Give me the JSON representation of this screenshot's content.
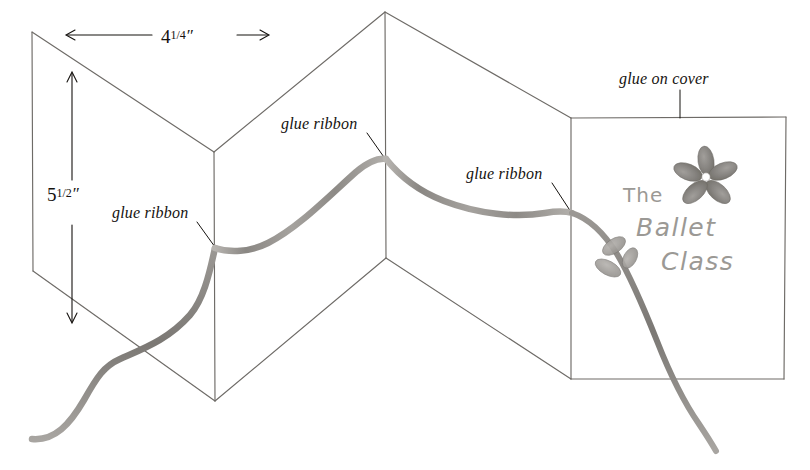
{
  "drawing": {
    "title": "Accordion-fold greeting card assembly diagram",
    "medium": "pencil sketch on white paper",
    "background_color": "#ffffff",
    "line_color": "#6e6b67",
    "ink_color": "#15120f",
    "ribbon_color": "#8d8a86",
    "cover_pencil_color": "#9b9995"
  },
  "dimensions": {
    "width": {
      "whole": "4",
      "fraction": "1/4",
      "unit": "″",
      "full": "4 1/4″"
    },
    "height": {
      "whole": "5",
      "fraction": "1/2",
      "unit": "″",
      "full": "5 1/2″"
    }
  },
  "labels": {
    "glue_ribbon_left": "glue ribbon",
    "glue_ribbon_center": "glue ribbon",
    "glue_ribbon_right": "glue ribbon",
    "glue_on_cover": "glue on cover"
  },
  "cover": {
    "line1": "The",
    "line2": "Ballet",
    "line3": "Class",
    "full_text": "The Ballet Class",
    "ornament": "flower-sprig"
  },
  "icons": {
    "arrow_left": "arrow-left-icon",
    "arrow_right": "arrow-right-icon",
    "arrow_up": "arrow-up-icon",
    "arrow_down": "arrow-down-icon",
    "flower": "flower-icon",
    "leaf": "leaf-icon",
    "ribbon": "ribbon-icon"
  }
}
